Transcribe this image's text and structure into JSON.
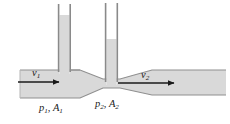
{
  "figure": {
    "kind": "venturi-tube-diagram",
    "width": 230,
    "height": 124,
    "background_color": "#ffffff"
  },
  "labels": {
    "velocity_left": {
      "symbol": "v",
      "subscript": "1"
    },
    "velocity_right": {
      "symbol": "v",
      "subscript": "2"
    },
    "pressure_area_left": {
      "pressure": "p",
      "pressure_sub": "1",
      "separator": ", ",
      "area": "A",
      "area_sub": "1"
    },
    "pressure_area_right": {
      "pressure": "p",
      "pressure_sub": "2",
      "separator": ", ",
      "area": "A",
      "area_sub": "2"
    }
  },
  "colors": {
    "pipe_fill": "#d9d9d9",
    "pipe_outline": "#8c8c8c",
    "tube_wall": "#8a8a8a",
    "tube_interior": "#ffffff",
    "liquid_fill": "#d9d9d9",
    "arrow": "#1a1a1a",
    "text": "#1a1a1a"
  },
  "geometry": {
    "pipe": {
      "left_x": 20,
      "right_x": 226,
      "wide_top_y": 70,
      "wide_bottom_y": 98,
      "throat_left_x": 103,
      "throat_right_x": 120,
      "throat_top_y": 79,
      "throat_bottom_y": 88,
      "taper_in_start_x": 80,
      "taper_out_end_x": 152
    },
    "standpipe_left": {
      "outer_left_x": 58,
      "outer_right_x": 71,
      "top_y": 4,
      "liquid_top_y": 15
    },
    "standpipe_right": {
      "outer_left_x": 105,
      "outer_right_x": 118,
      "top_y": 3,
      "liquid_top_y": 39
    },
    "arrow_left": {
      "x1": 18,
      "x2": 61,
      "y": 82
    },
    "arrow_right": {
      "x1": 118,
      "x2": 176,
      "y": 83
    }
  },
  "physics_annotation": {
    "description": "Fluid flows left to right through a constricted pipe; velocity increases and pressure drops at the narrow throat.",
    "left_section_label": "wide section",
    "right_section_label": "wide section",
    "throat_label": "constriction"
  }
}
